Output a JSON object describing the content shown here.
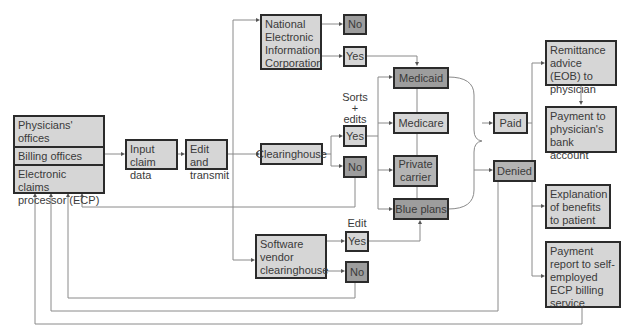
{
  "diagram": {
    "type": "flowchart",
    "sources": {
      "items": [
        "Physicians' offices",
        "Billing offices",
        "Electronic claims processor (ECP)"
      ]
    },
    "input_claim": "Input claim data",
    "edit_transmit": "Edit and transmit",
    "neic": "National Electronic Information Corporation",
    "neic_no": "No",
    "neic_yes": "Yes",
    "clearinghouse": "Clearinghouse",
    "sorts_label": "Sorts + edits",
    "sorts_line1": "Sorts",
    "sorts_line2": "+",
    "sorts_line3": "edits",
    "clearing_yes": "Yes",
    "clearing_no": "No",
    "vendor": "Software vendor clearinghouse",
    "edit_label": "Edit",
    "vendor_yes": "Yes",
    "vendor_no": "No",
    "payers": [
      "Medicaid",
      "Medicare",
      "Private carrier",
      "Blue plans"
    ],
    "paid": "Paid",
    "denied": "Denied",
    "outcomes": [
      "Remittance advice (EOB) to physician",
      "Payment to physician's bank account",
      "Explanation of benefits to patient",
      "Payment report to self-employed ECP billing service"
    ],
    "colors": {
      "box_light": "#d6d6d6",
      "box_dark": "#9d9d9d",
      "border": "#2b2b2b",
      "line": "#8a8a8a"
    }
  }
}
